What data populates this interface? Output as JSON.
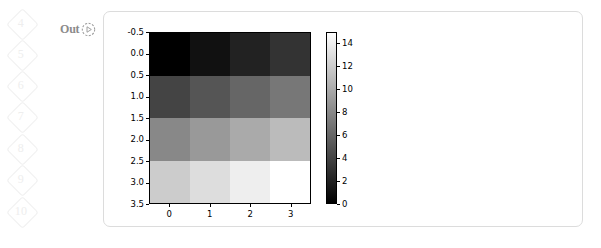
{
  "gutter": {
    "items": [
      {
        "number": "4",
        "top": 8
      },
      {
        "number": "5",
        "top": 39
      },
      {
        "number": "6",
        "top": 70
      },
      {
        "number": "7",
        "top": 101
      },
      {
        "number": "8",
        "top": 133
      },
      {
        "number": "9",
        "top": 164
      },
      {
        "number": "10",
        "top": 196
      }
    ]
  },
  "prompt": {
    "out_label": "Out",
    "run_icon": "play-circle-icon"
  },
  "chart_data": {
    "type": "heatmap",
    "title": "",
    "xlabel": "",
    "ylabel": "",
    "colormap": "gray",
    "grid": false,
    "legend_position": "right",
    "xticks": [
      "0",
      "1",
      "2",
      "3"
    ],
    "yticks": [
      "-0.5",
      "0.0",
      "0.5",
      "1.0",
      "1.5",
      "2.0",
      "2.5",
      "3.0",
      "3.5"
    ],
    "xlim": [
      -0.5,
      3.5
    ],
    "ylim": [
      3.5,
      -0.5
    ],
    "values": [
      [
        0,
        1,
        2,
        3
      ],
      [
        4,
        5,
        6,
        7
      ],
      [
        8,
        9,
        10,
        11
      ],
      [
        12,
        13,
        14,
        15
      ]
    ],
    "vmin": 0,
    "vmax": 15,
    "colorbar": {
      "ticks": [
        "14",
        "12",
        "10",
        "8",
        "6",
        "4",
        "2",
        "0"
      ],
      "tick_values": [
        14,
        12,
        10,
        8,
        6,
        4,
        2,
        0
      ],
      "range": [
        0,
        15
      ],
      "low_color": "#000000",
      "high_color": "#ffffff"
    }
  }
}
